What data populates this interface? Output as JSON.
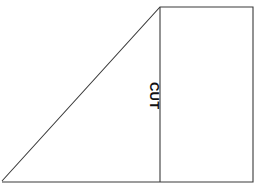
{
  "diagram": {
    "background_color": "#ffffff",
    "line_color": "#3a3a3a",
    "label_color": "#111111",
    "labels": {
      "cut": "CUT"
    },
    "geometry": {
      "width": 258,
      "height": 189,
      "outline_points": "2,181 160,7 253,7 253,182 2,182",
      "cut_line": {
        "x1": 160,
        "y1": 7,
        "x2": 160,
        "y2": 182
      },
      "vertices": [
        {
          "name": "bottom-left",
          "x": 2,
          "y": 182
        },
        {
          "name": "apex-top-left",
          "x": 160,
          "y": 7
        },
        {
          "name": "top-right",
          "x": 253,
          "y": 7
        },
        {
          "name": "bottom-right",
          "x": 253,
          "y": 182
        }
      ]
    }
  }
}
